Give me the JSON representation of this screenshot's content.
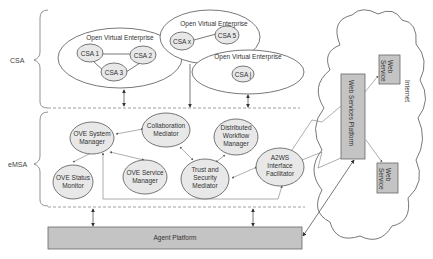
{
  "layers": {
    "csa": "CSA",
    "emsa": "eMSA"
  },
  "ove": {
    "ove1": {
      "title": "Open Virtual Enterprise",
      "nodes": [
        "CSA 1",
        "CSA 2",
        "CSA 3"
      ]
    },
    "ove2": {
      "title": "Open Virtual Enterprise",
      "nodes": [
        "CSA x",
        "CSA 5"
      ]
    },
    "ove3": {
      "title": "Open Virtual Enterprise",
      "nodes": [
        "CSA j"
      ]
    }
  },
  "emsa_components": {
    "system_manager": [
      "OVE System",
      "Manager"
    ],
    "collaboration_mediator": [
      "Collaboration",
      "Mediator"
    ],
    "distributed_workflow_manager": [
      "Distributed",
      "Workflow",
      "Manager"
    ],
    "status_monitor": [
      "OVE Status",
      "Monitor"
    ],
    "service_manager": [
      "OVE Service",
      "Manager"
    ],
    "trust_security_mediator": [
      "Trust and",
      "Security",
      "Mediator"
    ],
    "a2ws_facilitator": [
      "A2WS",
      "Interface",
      "Facilitator"
    ]
  },
  "platforms": {
    "agent_platform": "Agent Platform",
    "web_services_platform": "Web Services Platform"
  },
  "internet": {
    "label": "Internet",
    "web_service_top": [
      "Web",
      "Service"
    ],
    "web_service_bottom": [
      "Web",
      "Service"
    ]
  },
  "colors": {
    "node_fill": "#e8e8e8",
    "platform_fill": "#c4c4c4",
    "stroke": "#555555"
  }
}
